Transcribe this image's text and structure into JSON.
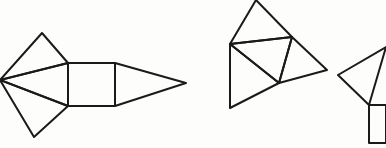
{
  "figure": {
    "stroke_color": "#1a1a1a",
    "background": "#fdfdfc",
    "nets": [
      {
        "id": "net-square-pyramid",
        "label": "",
        "polygons": [
          {
            "name": "top-kite-triangle",
            "points": "0,80 42,33 68,63"
          },
          {
            "name": "upper-inner-triangle",
            "points": "0,80 68,63 68,106"
          },
          {
            "name": "bottom-kite-triangle",
            "points": "0,80 68,106 34,137"
          },
          {
            "name": "square-base",
            "points": "68,63 115,63 115,106 68,106"
          },
          {
            "name": "right-triangle",
            "points": "115,63 186,83 115,106"
          }
        ]
      },
      {
        "id": "net-tetrahedron",
        "label": "",
        "polygons": [
          {
            "name": "top-triangle",
            "points": "256,0 230,44 292,37"
          },
          {
            "name": "center-triangle",
            "points": "230,44 292,37 279,83"
          },
          {
            "name": "right-triangle",
            "points": "292,37 327,70 279,83"
          },
          {
            "name": "bottom-left-triangle",
            "points": "230,44 279,83 230,108"
          }
        ]
      },
      {
        "id": "net-partial",
        "label": "",
        "polygons": [
          {
            "name": "left-triangle",
            "points": "386,47 338,75 369,105"
          },
          {
            "name": "partial-square",
            "points": "386,105 369,105 369,143 386,143"
          }
        ]
      }
    ]
  }
}
